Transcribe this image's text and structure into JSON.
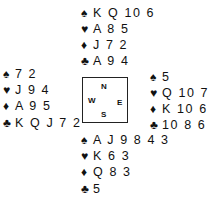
{
  "diagram": {
    "hands": {
      "north": {
        "spades": "K Q 10 6",
        "hearts": "A 8 5",
        "diamonds": "J 7 2",
        "clubs": "A 9 4"
      },
      "west": {
        "spades": "7 2",
        "hearts": "J 9 4",
        "diamonds": "A 9 5",
        "clubs": "K Q J 7 2"
      },
      "east": {
        "spades": "5",
        "hearts": "Q 10 7 2",
        "diamonds": "K 10 6 4",
        "clubs": "10 8 6 3"
      },
      "south": {
        "spades": "A J 9 8 4 3",
        "hearts": "K 6 3",
        "diamonds": "Q 8 3",
        "clubs": "5"
      }
    },
    "suit_symbols": {
      "spades": "♠",
      "hearts": "♥",
      "diamonds": "♦",
      "clubs": "♣"
    },
    "compass": {
      "north": "N",
      "south": "S",
      "east": "E",
      "west": "W"
    }
  }
}
